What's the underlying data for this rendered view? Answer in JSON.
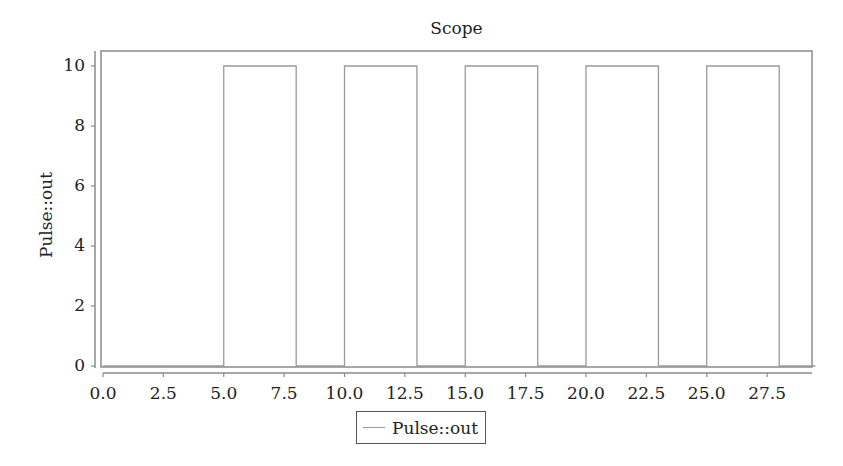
{
  "chart_data": {
    "type": "line",
    "title": "Scope",
    "xlabel": "",
    "ylabel": "Pulse::out",
    "xlim": [
      0,
      29.5
    ],
    "ylim": [
      0,
      10.5
    ],
    "x_ticks": [
      "0.0",
      "2.5",
      "5.0",
      "7.5",
      "10.0",
      "12.5",
      "15.0",
      "17.5",
      "20.0",
      "22.5",
      "25.0",
      "27.5"
    ],
    "y_ticks": [
      "0",
      "2",
      "4",
      "6",
      "8",
      "10"
    ],
    "grid": false,
    "legend_position": "bottom",
    "series": [
      {
        "name": "Pulse::out",
        "color": "#999999",
        "x": [
          0,
          5,
          5,
          8,
          8,
          10,
          10,
          13,
          13,
          15,
          15,
          18,
          18,
          20,
          20,
          23,
          23,
          25,
          25,
          28,
          28,
          29.5
        ],
        "y": [
          0,
          0,
          10,
          10,
          0,
          0,
          10,
          10,
          0,
          0,
          10,
          10,
          0,
          0,
          10,
          10,
          0,
          0,
          10,
          10,
          0,
          0
        ]
      }
    ]
  },
  "legend": {
    "items": [
      {
        "label": "Pulse::out",
        "color": "#999999"
      }
    ]
  }
}
